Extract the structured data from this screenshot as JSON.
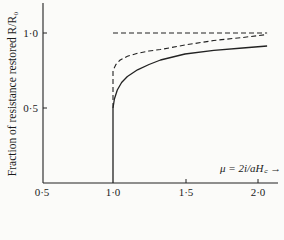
{
  "chart_data": {
    "type": "line",
    "title": "",
    "xlabel": "μ = 2i/aH_c →",
    "ylabel": "Fraction of resistance restored R/R₀",
    "xlim": [
      0.5,
      2.12
    ],
    "ylim": [
      0,
      1.2
    ],
    "x_ticks": [
      "0·5",
      "1·0",
      "1·5",
      "2·0"
    ],
    "y_ticks": [
      "0·5",
      "1·0"
    ],
    "grid": false,
    "legend": null,
    "series": [
      {
        "name": "limit R/R0 = 1",
        "style": "dashed",
        "x": [
          1.0,
          2.07
        ],
        "y": [
          1.0,
          1.0
        ]
      },
      {
        "name": "dashed curve",
        "style": "dashed",
        "x": [
          1.0,
          1.0,
          1.02,
          1.05,
          1.1,
          1.17,
          1.25,
          1.33,
          1.5,
          1.7,
          1.9,
          2.07
        ],
        "y": [
          0.5,
          0.75,
          0.79,
          0.82,
          0.845,
          0.865,
          0.88,
          0.89,
          0.92,
          0.95,
          0.97,
          0.99
        ]
      },
      {
        "name": "solid curve",
        "style": "solid",
        "x": [
          1.0,
          1.0,
          1.01,
          1.03,
          1.06,
          1.1,
          1.17,
          1.25,
          1.33,
          1.5,
          1.7,
          1.9,
          2.07
        ],
        "y": [
          0.0,
          0.5,
          0.56,
          0.62,
          0.67,
          0.71,
          0.755,
          0.79,
          0.82,
          0.86,
          0.885,
          0.9,
          0.913
        ]
      }
    ]
  },
  "labels": {
    "ylabel": "Fraction of resistance restored R/R₀",
    "xlabel": "μ = 2i/aH꜀ →",
    "xticks": [
      "0·5",
      "1·0",
      "1·5",
      "2·0"
    ],
    "yticks": [
      "0·5",
      "1·0"
    ]
  }
}
